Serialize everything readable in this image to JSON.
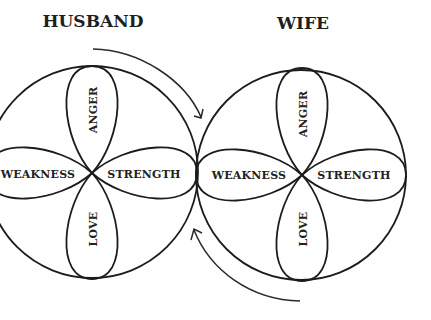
{
  "diagram": {
    "colors": {
      "background": "#ffffff",
      "line": "#1c1c1c",
      "text": "#222222"
    },
    "husband": {
      "title": "HUSBAND",
      "petals": {
        "top": "ANGER",
        "left": "WEAKNESS",
        "right": "STRENGTH",
        "bottom": "LOVE"
      }
    },
    "wife": {
      "title": "WIFE",
      "petals": {
        "top": "ANGER",
        "left": "WEAKNESS",
        "right": "STRENGTH",
        "bottom": "LOVE"
      }
    },
    "arrows": [
      {
        "name": "husband-to-wife",
        "direction": "clockwise, top, pointing down-right"
      },
      {
        "name": "wife-to-husband",
        "direction": "bottom, pointing up-left"
      }
    ]
  }
}
